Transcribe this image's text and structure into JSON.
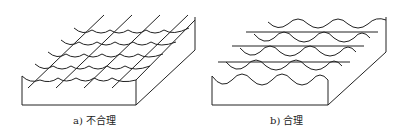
{
  "figures": [
    {
      "id": "a",
      "caption": "a) 不合理",
      "description": "Block with scalloped surface; grinding lines run diagonally along the cusps"
    },
    {
      "id": "b",
      "caption": "b) 合理",
      "description": "Block with scalloped surface; grinding lines run horizontally across the cusps"
    }
  ],
  "colors": {
    "stroke": "#222222",
    "background": "#ffffff"
  }
}
